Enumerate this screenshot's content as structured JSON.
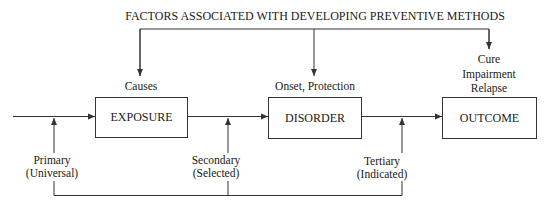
{
  "diagram": {
    "title": "FACTORS ASSOCIATED WITH DEVELOPING PREVENTIVE METHODS",
    "boxes": [
      {
        "label": "EXPOSURE",
        "annotation": [
          "Causes"
        ]
      },
      {
        "label": "DISORDER",
        "annotation": [
          "Onset, Protection"
        ]
      },
      {
        "label": "OUTCOME",
        "annotation": [
          "Cure",
          "Impairment",
          "Relapse"
        ]
      }
    ],
    "prevention_levels": [
      {
        "name": "Primary",
        "qualifier": "(Universal)"
      },
      {
        "name": "Secondary",
        "qualifier": "(Selected)"
      },
      {
        "name": "Tertiary",
        "qualifier": "(Indicated)"
      }
    ],
    "colors": {
      "line": "#333333",
      "text": "#1a1a1a",
      "background": "#ffffff"
    }
  }
}
